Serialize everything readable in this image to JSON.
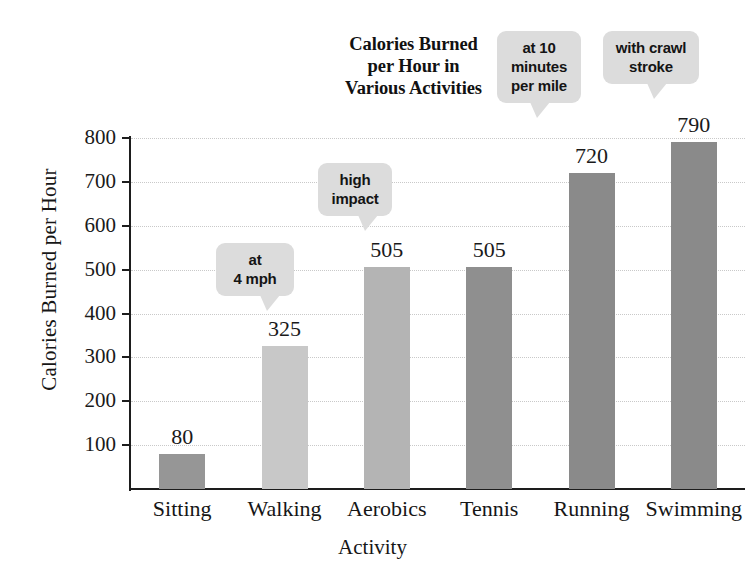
{
  "chart_data": {
    "type": "bar",
    "title": "Calories Burned per Hour in Various Activities",
    "title_lines": [
      "Calories Burned",
      "per Hour in",
      "Various Activities"
    ],
    "xlabel": "Activity",
    "ylabel": "Calories Burned per Hour",
    "categories": [
      "Sitting",
      "Walking",
      "Aerobics",
      "Tennis",
      "Running",
      "Swimming"
    ],
    "values": [
      80,
      325,
      505,
      505,
      720,
      790
    ],
    "value_labels": [
      "80",
      "325",
      "505",
      "505",
      "720",
      "790"
    ],
    "ylim": [
      0,
      800
    ],
    "yticks": [
      100,
      200,
      300,
      400,
      500,
      600,
      700,
      800
    ],
    "ytick_labels": [
      "100",
      "200",
      "300",
      "400",
      "500",
      "600",
      "700",
      "800"
    ],
    "grid": true,
    "grid_axis": "y",
    "legend": "none",
    "bar_colors": [
      "#969696",
      "#c8c8c8",
      "#b4b4b4",
      "#8f8f8f",
      "#8a8a8a",
      "#8a8a8a"
    ],
    "annotations": [
      {
        "target": "Walking",
        "lines": [
          "at",
          "4 mph"
        ]
      },
      {
        "target": "Aerobics",
        "lines": [
          "high",
          "impact"
        ]
      },
      {
        "target": "Running",
        "lines": [
          "at 10",
          "minutes",
          "per mile"
        ]
      },
      {
        "target": "Swimming",
        "lines": [
          "with crawl",
          "stroke"
        ]
      }
    ]
  },
  "style": {
    "background": "#ffffff",
    "axis_color": "#1d1d1d",
    "grid_color": "#c9c9c9",
    "callout_bg": "#dcdcdc",
    "text_color": "#1a1a1a"
  }
}
